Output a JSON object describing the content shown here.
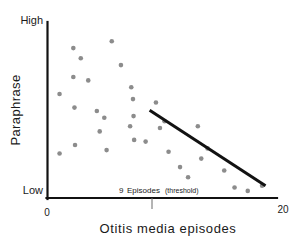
{
  "chart_data": {
    "type": "scatter",
    "title": "",
    "xlabel": "Otitis  media  episodes",
    "ylabel": "Paraphrase",
    "xlim": [
      0,
      20
    ],
    "ylim": [
      0,
      1
    ],
    "grid": false,
    "legend": null,
    "x_ticks": [
      {
        "value": 0,
        "label": "0"
      },
      {
        "value": 20,
        "label": "20"
      }
    ],
    "y_ticks": [
      {
        "value": 1,
        "label": "High"
      },
      {
        "value": 0,
        "label": "Low"
      }
    ],
    "annotations": [
      {
        "name": "threshold-marker",
        "x": 9,
        "number": "9",
        "word": "Episodes",
        "paren": "(threshold)",
        "full_text": "9  Episodes  (threshold)"
      }
    ],
    "series": [
      {
        "name": "observations",
        "type": "scatter",
        "color": "#8c8c8c",
        "points": [
          {
            "x": 1.05,
            "y": 0.6
          },
          {
            "x": 1.05,
            "y": 0.25
          },
          {
            "x": 2.25,
            "y": 0.87
          },
          {
            "x": 2.25,
            "y": 0.7
          },
          {
            "x": 2.35,
            "y": 0.52
          },
          {
            "x": 2.4,
            "y": 0.3
          },
          {
            "x": 2.9,
            "y": 0.81
          },
          {
            "x": 3.55,
            "y": 0.68
          },
          {
            "x": 4.3,
            "y": 0.5
          },
          {
            "x": 4.55,
            "y": 0.38
          },
          {
            "x": 4.95,
            "y": 0.46
          },
          {
            "x": 5.15,
            "y": 0.27
          },
          {
            "x": 5.6,
            "y": 0.91
          },
          {
            "x": 6.4,
            "y": 0.77
          },
          {
            "x": 7.3,
            "y": 0.64
          },
          {
            "x": 7.45,
            "y": 0.57
          },
          {
            "x": 7.5,
            "y": 0.47
          },
          {
            "x": 7.55,
            "y": 0.33
          },
          {
            "x": 7.2,
            "y": 0.41
          },
          {
            "x": 8.55,
            "y": 0.32
          },
          {
            "x": 9.45,
            "y": 0.55
          },
          {
            "x": 9.8,
            "y": 0.4
          },
          {
            "x": 10.2,
            "y": 0.44
          },
          {
            "x": 10.55,
            "y": 0.26
          },
          {
            "x": 11.55,
            "y": 0.17
          },
          {
            "x": 12.25,
            "y": 0.11
          },
          {
            "x": 13.1,
            "y": 0.41
          },
          {
            "x": 13.4,
            "y": 0.22
          },
          {
            "x": 13.95,
            "y": 0.28
          },
          {
            "x": 15.4,
            "y": 0.15
          },
          {
            "x": 16.3,
            "y": 0.05
          },
          {
            "x": 17.45,
            "y": 0.03
          },
          {
            "x": 18.7,
            "y": 0.06
          }
        ]
      },
      {
        "name": "trend-line",
        "type": "line",
        "color": "#121212",
        "start": {
          "x": 8.9,
          "y": 0.505
        },
        "end": {
          "x": 19.0,
          "y": 0.06
        }
      }
    ]
  },
  "axes": {
    "y_top_label": "High",
    "y_bottom_label": "Low",
    "y_title": "Paraphrase",
    "x_origin_label": "0",
    "x_max_label": "20",
    "x_title": "Otitis  media  episodes"
  },
  "threshold": {
    "number": "9",
    "word": "Episodes",
    "paren": "(threshold)"
  }
}
